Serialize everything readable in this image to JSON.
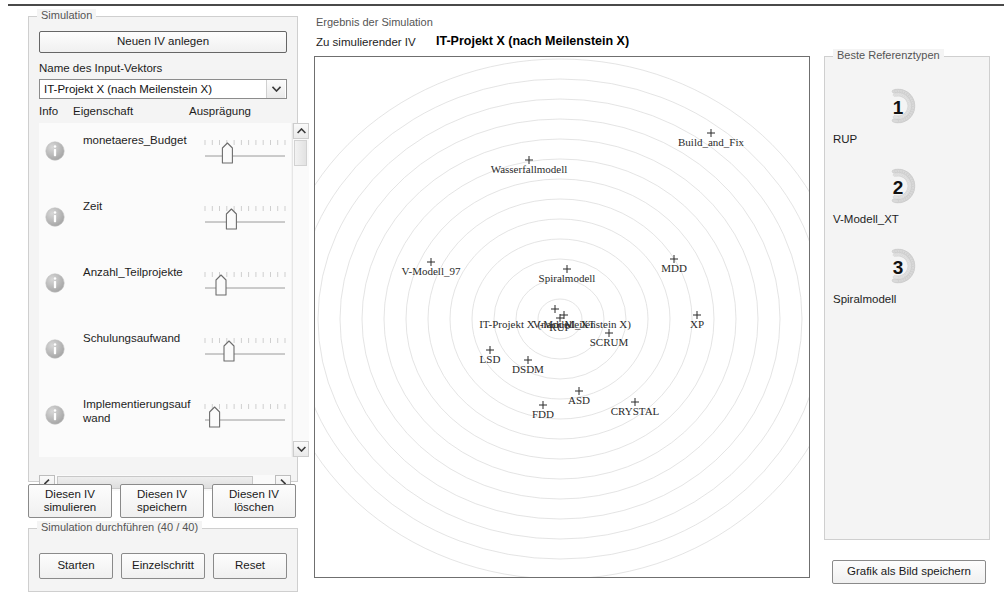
{
  "window": {
    "background": "#f4f4f4",
    "accent": "#4a4a4a"
  },
  "left_panel": {
    "group_title": "Simulation",
    "new_iv_button": "Neuen IV anlegen",
    "name_label": "Name des Input-Vektors",
    "combo": {
      "selected": "IT-Projekt X  (nach Meilenstein X)",
      "options": [
        "IT-Projekt X  (nach Meilenstein X)"
      ]
    },
    "column_headers": {
      "info": "Info",
      "property": "Eigenschaft",
      "value": "Ausprägung"
    },
    "properties": [
      {
        "name": "monetaeres_Budget",
        "slider_percent": 28
      },
      {
        "name": "Zeit",
        "slider_percent": 33
      },
      {
        "name": "Anzahl_Teilprojekte",
        "slider_percent": 20
      },
      {
        "name": "Schulungsaufwand",
        "slider_percent": 30
      },
      {
        "name": "Implementierungsaufwand",
        "slider_percent": 12
      }
    ],
    "row_buttons": [
      "Diesen IV\nsimulieren",
      "Diesen IV\nspeichern",
      "Diesen IV\nlöschen"
    ],
    "run_group": {
      "title": "Simulation durchführen (40 / 40)",
      "buttons": [
        "Starten",
        "Einzelschritt",
        "Reset"
      ]
    }
  },
  "center_panel": {
    "group_title": "Ergebnis der Simulation",
    "iv_caption": "Zu simulierender IV",
    "iv_name": "IT-Projekt X  (nach Meilenstein X)"
  },
  "right_panel": {
    "group_title": "Beste Referenztypen",
    "ranks": [
      {
        "place": "1",
        "name": "RUP"
      },
      {
        "place": "2",
        "name": "V-Modell_XT"
      },
      {
        "place": "3",
        "name": "Spiralmodell"
      }
    ],
    "save_image_button": "Grafik als Bild speichern"
  },
  "chart_data": {
    "type": "scatter",
    "title": "",
    "xlabel": "",
    "ylabel": "",
    "grid": "concentric-ellipses",
    "legend": "none",
    "xlim": [
      0,
      496
    ],
    "ylim": [
      0,
      522
    ],
    "center": {
      "x": 245,
      "y": 262
    },
    "rings": 13,
    "ring_step_x": 22,
    "ring_step_y": 20,
    "points": [
      {
        "label": "Build_and_Fix",
        "x": 396,
        "y": 76,
        "label_dx": 0,
        "label_dy": 13,
        "anchor": "middle"
      },
      {
        "label": "Wasserfallmodell",
        "x": 214,
        "y": 103,
        "label_dx": 0,
        "label_dy": 13,
        "anchor": "middle"
      },
      {
        "label": "V-Modell_97",
        "x": 116,
        "y": 205,
        "label_dx": 0,
        "label_dy": 13,
        "anchor": "middle"
      },
      {
        "label": "Spiralmodell",
        "x": 252,
        "y": 212,
        "label_dx": 0,
        "label_dy": 13,
        "anchor": "middle"
      },
      {
        "label": "MDD",
        "x": 359,
        "y": 202,
        "label_dx": 0,
        "label_dy": 13,
        "anchor": "middle"
      },
      {
        "label": "XP",
        "x": 382,
        "y": 258,
        "label_dx": 0,
        "label_dy": 13,
        "anchor": "middle"
      },
      {
        "label": "V-Modell_XT",
        "x": 249,
        "y": 258,
        "label_dx": 0,
        "label_dy": 13,
        "anchor": "middle"
      },
      {
        "label": "RUP",
        "x": 245,
        "y": 261,
        "label_dx": 0,
        "label_dy": 13,
        "anchor": "middle"
      },
      {
        "label": "IT-Projekt X  (nach Meilenstein X)",
        "x": 240,
        "y": 252,
        "label_dx": 0,
        "label_dy": 19,
        "anchor": "middle"
      },
      {
        "label": "SCRUM",
        "x": 294,
        "y": 276,
        "label_dx": 0,
        "label_dy": 13,
        "anchor": "middle"
      },
      {
        "label": "LSD",
        "x": 175,
        "y": 293,
        "label_dx": 0,
        "label_dy": 13,
        "anchor": "middle"
      },
      {
        "label": "DSDM",
        "x": 213,
        "y": 303,
        "label_dx": 0,
        "label_dy": 13,
        "anchor": "middle"
      },
      {
        "label": "ASD",
        "x": 264,
        "y": 334,
        "label_dx": 0,
        "label_dy": 13,
        "anchor": "middle"
      },
      {
        "label": "FDD",
        "x": 228,
        "y": 348,
        "label_dx": 0,
        "label_dy": 13,
        "anchor": "middle"
      },
      {
        "label": "CRYSTAL",
        "x": 320,
        "y": 345,
        "label_dx": 0,
        "label_dy": 13,
        "anchor": "middle"
      }
    ]
  }
}
